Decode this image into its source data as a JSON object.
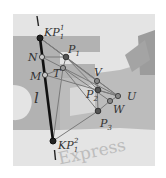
{
  "figure": {
    "background_photo": {
      "description": "grayscale photo of FedEx Express logo",
      "watermark_text": "Express",
      "frame": [
        13,
        14,
        155,
        166
      ]
    },
    "line": {
      "label": "l",
      "from": [
        37,
        16
      ],
      "to": [
        55,
        160
      ]
    },
    "points": [
      {
        "id": "KP11",
        "label": "KP",
        "sub": "1",
        "sup": "1",
        "x": 40,
        "y": 38,
        "style": "solid-dark"
      },
      {
        "id": "KP12",
        "label": "KP",
        "sub": "1",
        "sup": "2",
        "x": 53,
        "y": 141,
        "style": "solid-dark"
      },
      {
        "id": "N",
        "label": "N",
        "x": 42,
        "y": 57,
        "style": "hollow"
      },
      {
        "id": "M",
        "label": "M",
        "x": 45,
        "y": 75,
        "style": "hollow"
      },
      {
        "id": "P1",
        "label": "P",
        "sub": "1",
        "x": 66,
        "y": 57,
        "style": "solid"
      },
      {
        "id": "T",
        "label": "T",
        "x": 63,
        "y": 68,
        "style": "hollow"
      },
      {
        "id": "V",
        "label": "V",
        "x": 97,
        "y": 81,
        "style": "hollow"
      },
      {
        "id": "P2",
        "label": "P",
        "sub": "2",
        "x": 98,
        "y": 90,
        "style": "solid"
      },
      {
        "id": "U",
        "label": "U",
        "x": 118,
        "y": 96,
        "style": "hollow"
      },
      {
        "id": "W",
        "label": "W",
        "x": 110,
        "y": 101,
        "style": "hollow"
      },
      {
        "id": "P3",
        "label": "P",
        "sub": "3",
        "x": 98,
        "y": 111,
        "style": "solid"
      }
    ],
    "labels": {
      "KP11": "KP",
      "KP11_sub": "1",
      "KP11_sup": "1",
      "KP12": "KP",
      "KP12_sub": "1",
      "KP12_sup": "2",
      "N": "N",
      "M": "M",
      "T": "T",
      "V": "V",
      "U": "U",
      "W": "W",
      "P1": "P",
      "P1_sub": "1",
      "P2": "P",
      "P2_sub": "2",
      "P3": "P",
      "P3_sub": "3",
      "l": "l",
      "express": "Express"
    }
  }
}
